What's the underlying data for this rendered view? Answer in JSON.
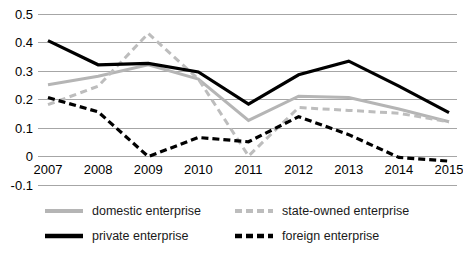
{
  "chart_data": {
    "type": "line",
    "title": "",
    "xlabel": "",
    "ylabel": "",
    "categories": [
      "2007",
      "2008",
      "2009",
      "2010",
      "2011",
      "2012",
      "2013",
      "2014",
      "2015"
    ],
    "x": [
      2007,
      2008,
      2009,
      2010,
      2011,
      2012,
      2013,
      2014,
      2015
    ],
    "ylim": [
      -0.1,
      0.5
    ],
    "yticks": [
      "0.5",
      "0.4",
      "0.3",
      "0.2",
      "0.1",
      "0",
      "-0.1"
    ],
    "ytick_values": [
      0.5,
      0.4,
      0.3,
      0.2,
      0.1,
      0,
      -0.1
    ],
    "grid": true,
    "legend_position": "bottom",
    "series": [
      {
        "name": "domestic enterprise",
        "style": "solid",
        "color": "#b5b5b5",
        "values": [
          0.25,
          0.28,
          0.32,
          0.27,
          0.125,
          0.21,
          0.205,
          0.165,
          0.12
        ]
      },
      {
        "name": "state-owned enterprise",
        "style": "dashed",
        "color": "#bdbdbd",
        "values": [
          0.18,
          0.245,
          0.43,
          0.27,
          0.0,
          0.17,
          0.16,
          0.15,
          0.12
        ]
      },
      {
        "name": "private enterprise",
        "style": "solid",
        "color": "#000000",
        "values": [
          0.405,
          0.32,
          0.325,
          0.295,
          0.182,
          0.285,
          0.333,
          0.245,
          0.152
        ]
      },
      {
        "name": "foreign enterprise",
        "style": "dashed",
        "color": "#000000",
        "values": [
          0.205,
          0.155,
          -0.002,
          0.065,
          0.05,
          0.138,
          0.075,
          -0.005,
          -0.018
        ]
      }
    ]
  },
  "legend": {
    "items": [
      {
        "label": "domestic enterprise",
        "swatch": "solid-gray-line-icon"
      },
      {
        "label": "state-owned enterprise",
        "swatch": "dashed-gray-line-icon"
      },
      {
        "label": "private enterprise",
        "swatch": "solid-black-line-icon"
      },
      {
        "label": "foreign enterprise",
        "swatch": "dashed-black-line-icon"
      }
    ]
  },
  "caption": {
    "text": ""
  }
}
